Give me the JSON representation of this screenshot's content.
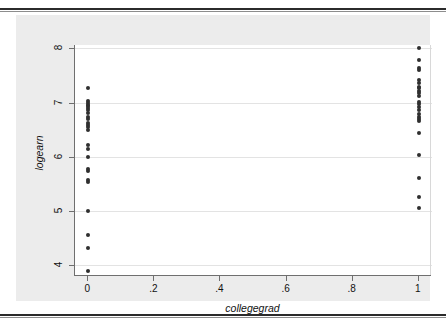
{
  "figure": {
    "background_color": "#ececec",
    "plot_background_color": "#ffffff",
    "gridline_color": "#e3e3e3",
    "marker_color": "#2f2f2f",
    "axis_color": "#6f6f6f"
  },
  "chart_data": {
    "type": "scatter",
    "title": "",
    "xlabel": "collegegrad",
    "ylabel": "logearn",
    "xlim": [
      -0.04,
      1.04
    ],
    "ylim": [
      3.82,
      8.06
    ],
    "xticks": [
      0,
      0.2,
      0.4,
      0.6,
      0.8,
      1
    ],
    "xtick_labels": [
      "0",
      ".2",
      ".4",
      ".6",
      ".8",
      "1"
    ],
    "yticks": [
      4,
      5,
      6,
      7,
      8
    ],
    "ytick_labels": [
      "4",
      "5",
      "6",
      "7",
      "8"
    ],
    "grid": "horizontal",
    "legend": "none",
    "series": [
      {
        "name": "logearn vs collegegrad",
        "marker": "filled-circle",
        "points": [
          {
            "x": 0,
            "y": 7.27
          },
          {
            "x": 0,
            "y": 7.03
          },
          {
            "x": 0,
            "y": 7.0
          },
          {
            "x": 0,
            "y": 6.96
          },
          {
            "x": 0,
            "y": 6.93
          },
          {
            "x": 0,
            "y": 6.9
          },
          {
            "x": 0,
            "y": 6.86
          },
          {
            "x": 0,
            "y": 6.8
          },
          {
            "x": 0,
            "y": 6.73
          },
          {
            "x": 0,
            "y": 6.7
          },
          {
            "x": 0,
            "y": 6.62
          },
          {
            "x": 0,
            "y": 6.58
          },
          {
            "x": 0,
            "y": 6.54
          },
          {
            "x": 0,
            "y": 6.5
          },
          {
            "x": 0,
            "y": 6.21
          },
          {
            "x": 0,
            "y": 6.15
          },
          {
            "x": 0,
            "y": 6.0
          },
          {
            "x": 0,
            "y": 5.78
          },
          {
            "x": 0,
            "y": 5.73
          },
          {
            "x": 0,
            "y": 5.57
          },
          {
            "x": 0,
            "y": 5.53
          },
          {
            "x": 0,
            "y": 5.0
          },
          {
            "x": 0,
            "y": 4.56
          },
          {
            "x": 0,
            "y": 4.31
          },
          {
            "x": 0,
            "y": 3.9
          },
          {
            "x": 1,
            "y": 8.0
          },
          {
            "x": 1,
            "y": 7.79
          },
          {
            "x": 1,
            "y": 7.63
          },
          {
            "x": 1,
            "y": 7.6
          },
          {
            "x": 1,
            "y": 7.42
          },
          {
            "x": 1,
            "y": 7.36
          },
          {
            "x": 1,
            "y": 7.29
          },
          {
            "x": 1,
            "y": 7.26
          },
          {
            "x": 1,
            "y": 7.22
          },
          {
            "x": 1,
            "y": 7.17
          },
          {
            "x": 1,
            "y": 7.12
          },
          {
            "x": 1,
            "y": 7.01
          },
          {
            "x": 1,
            "y": 6.97
          },
          {
            "x": 1,
            "y": 6.92
          },
          {
            "x": 1,
            "y": 6.87
          },
          {
            "x": 1,
            "y": 6.79
          },
          {
            "x": 1,
            "y": 6.74
          },
          {
            "x": 1,
            "y": 6.7
          },
          {
            "x": 1,
            "y": 6.65
          },
          {
            "x": 1,
            "y": 6.43
          },
          {
            "x": 1,
            "y": 6.03
          },
          {
            "x": 1,
            "y": 5.6
          },
          {
            "x": 1,
            "y": 5.26
          },
          {
            "x": 1,
            "y": 5.05
          }
        ]
      }
    ]
  }
}
